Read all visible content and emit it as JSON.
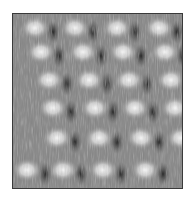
{
  "image": {
    "description": "Grayscale scanning-probe microscopy image of a periodic atomic lattice with tilted rows of bright protrusions",
    "colormap": "grayscale",
    "background_gray": "#8a8a8a",
    "bright_color": "#f2f2f2",
    "dark_color": "#2a2a2a",
    "border_color": "#3a3a3a",
    "lattice": {
      "rows": [
        {
          "y": 14,
          "x": [
            22,
            62,
            104,
            146
          ]
        },
        {
          "y": 38,
          "x": [
            28,
            70,
            110,
            152
          ]
        },
        {
          "y": 66,
          "x": [
            36,
            76,
            116,
            158
          ]
        },
        {
          "y": 94,
          "x": [
            40,
            82,
            122,
            162
          ]
        },
        {
          "y": 124,
          "x": [
            44,
            86,
            128,
            168
          ]
        },
        {
          "y": 156,
          "x": [
            14,
            50,
            90,
            132
          ]
        }
      ]
    }
  }
}
